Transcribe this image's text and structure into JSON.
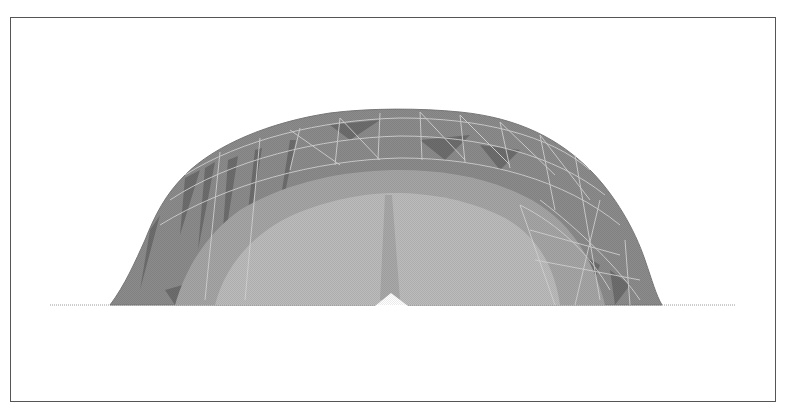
{
  "figure": {
    "frame_border_color": "#555555",
    "background_color": "#ffffff",
    "mesh": {
      "outer_band_color": "#8c8c8c",
      "outer_dark_facet_color": "#6e6e6e",
      "inner_band_color": "#a6a6a6",
      "core_color": "#bcbcbc",
      "edge_line_color": "#d6d6d6"
    },
    "baseline": {
      "color": "#9a9a9a",
      "style": "dotted"
    }
  }
}
